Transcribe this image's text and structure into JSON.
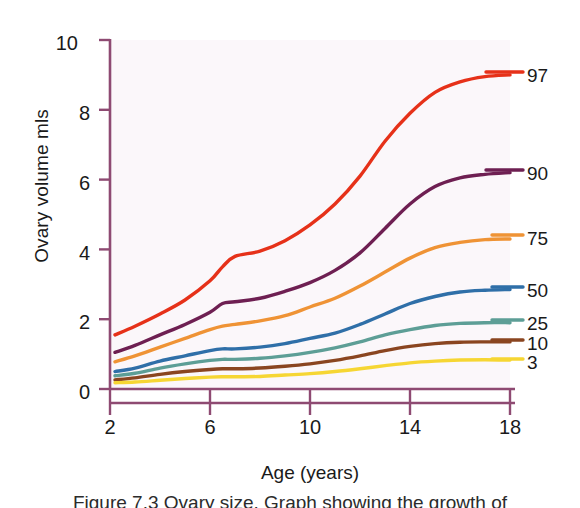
{
  "figure": {
    "caption": "Figure 7.3   Ovary size. Graph showing the growth of"
  },
  "axes": {
    "ylabel": "Ovary volume mls",
    "xlabel": "Age (years)",
    "yticks": [
      "0",
      "2",
      "4",
      "6",
      "8",
      "10"
    ],
    "xticks": [
      "2",
      "6",
      "10",
      "14",
      "18"
    ],
    "axis_color": "#8e4a72"
  },
  "series_labels": [
    "97",
    "90",
    "75",
    "50",
    "25",
    "10",
    "3"
  ],
  "colors": {
    "p97": "#e63119",
    "p90": "#6e1f52",
    "p75": "#ef9335",
    "p50": "#2f6fa8",
    "p25": "#5d9e96",
    "p10": "#8a4520",
    "p3": "#f6d633"
  },
  "chart_data": {
    "type": "line",
    "title": "",
    "subtitle": "",
    "xlabel": "Age (years)",
    "ylabel": "Ovary volume mls",
    "xlim": [
      2,
      18
    ],
    "ylim": [
      0,
      10
    ],
    "xticks": [
      2,
      6,
      10,
      14,
      18
    ],
    "yticks": [
      0,
      2,
      4,
      6,
      8,
      10
    ],
    "grid": false,
    "legend": "right-of-plot (inline end-of-line labels)",
    "annotations": [
      "Percentile labels 97, 90, 75, 50, 25, 10, 3 at the right end of each curve"
    ],
    "x": [
      2.2,
      3,
      4,
      5,
      6,
      6.5,
      7,
      8,
      9,
      10,
      11,
      12,
      13,
      14,
      15,
      16,
      17,
      18
    ],
    "series": [
      {
        "name": "97",
        "percentile": 97,
        "color": "#e63119",
        "values": [
          1.55,
          1.8,
          2.15,
          2.55,
          3.1,
          3.5,
          3.8,
          3.95,
          4.25,
          4.7,
          5.3,
          6.1,
          7.1,
          7.9,
          8.5,
          8.8,
          8.95,
          9.0
        ]
      },
      {
        "name": "90",
        "percentile": 90,
        "color": "#6e1f52",
        "values": [
          1.05,
          1.25,
          1.55,
          1.85,
          2.2,
          2.45,
          2.5,
          2.6,
          2.8,
          3.05,
          3.4,
          3.9,
          4.6,
          5.3,
          5.8,
          6.05,
          6.15,
          6.2
        ]
      },
      {
        "name": "75",
        "percentile": 75,
        "color": "#ef9335",
        "values": [
          0.78,
          0.95,
          1.2,
          1.45,
          1.7,
          1.8,
          1.85,
          1.95,
          2.1,
          2.35,
          2.6,
          2.95,
          3.35,
          3.75,
          4.05,
          4.2,
          4.28,
          4.3
        ]
      },
      {
        "name": "50",
        "percentile": 50,
        "color": "#2f6fa8",
        "values": [
          0.5,
          0.6,
          0.8,
          0.95,
          1.1,
          1.15,
          1.15,
          1.2,
          1.3,
          1.45,
          1.6,
          1.85,
          2.15,
          2.45,
          2.65,
          2.78,
          2.83,
          2.85
        ]
      },
      {
        "name": "25",
        "percentile": 25,
        "color": "#5d9e96",
        "values": [
          0.38,
          0.45,
          0.6,
          0.72,
          0.82,
          0.85,
          0.85,
          0.88,
          0.95,
          1.05,
          1.18,
          1.35,
          1.55,
          1.7,
          1.82,
          1.88,
          1.9,
          1.9
        ]
      },
      {
        "name": "10",
        "percentile": 10,
        "color": "#8a4520",
        "values": [
          0.26,
          0.32,
          0.42,
          0.5,
          0.56,
          0.58,
          0.58,
          0.6,
          0.65,
          0.72,
          0.82,
          0.95,
          1.1,
          1.22,
          1.3,
          1.34,
          1.35,
          1.35
        ]
      },
      {
        "name": "3",
        "percentile": 3,
        "color": "#f6d633",
        "values": [
          0.18,
          0.2,
          0.25,
          0.3,
          0.34,
          0.35,
          0.35,
          0.36,
          0.4,
          0.44,
          0.5,
          0.58,
          0.67,
          0.75,
          0.8,
          0.83,
          0.84,
          0.83
        ]
      }
    ]
  }
}
